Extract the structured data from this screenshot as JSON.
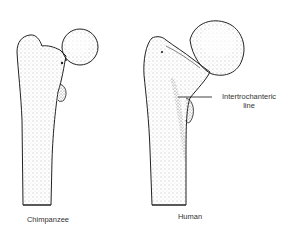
{
  "figure": {
    "specimens": [
      {
        "id": "chimpanzee",
        "label": "Chimpanzee"
      },
      {
        "id": "human",
        "label": "Human"
      }
    ],
    "annotations": [
      {
        "target": "human",
        "text_line1": "Intertrochanteric",
        "text_line2": "line"
      }
    ],
    "colors": {
      "ink": "#222222",
      "stipple": "#555555",
      "background": "#ffffff"
    }
  }
}
